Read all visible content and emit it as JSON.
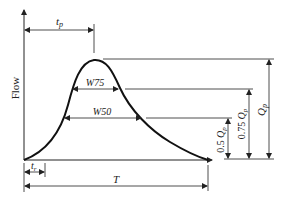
{
  "diagram": {
    "y_axis_label": "Flow",
    "labels": {
      "tp": "t",
      "tp_sub": "p",
      "tr": "t",
      "tr_sub": "r",
      "T": "T",
      "W75": "W75",
      "W50": "W50",
      "Qp_main": "Q",
      "Qp_sub": "p",
      "q075_coef": "0.75 ",
      "q075_var": "Q",
      "q075_sub": "p",
      "q05_coef": "0.5 ",
      "q05_var": "Q",
      "q05_sub": "p"
    },
    "colors": {
      "line": "#222222",
      "curve": "#111111",
      "background": "#ffffff"
    }
  }
}
